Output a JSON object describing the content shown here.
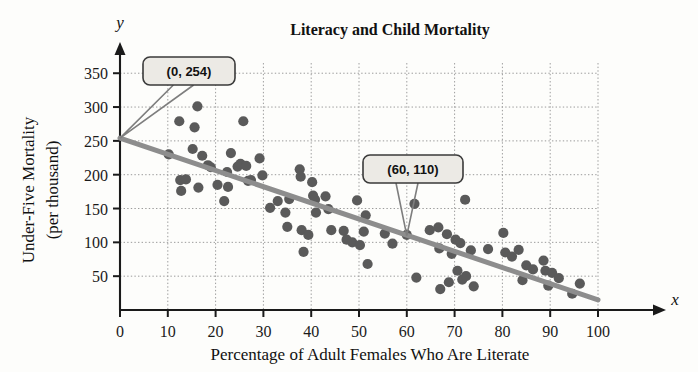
{
  "chart_data": {
    "type": "scatter",
    "title": "Literacy and Child Mortality",
    "xlabel": "Percentage of Adult Females Who Are Literate",
    "ylabel": "Under-Five Mortality\n(per thousand)",
    "ylabel_line1": "Under-Five Mortality",
    "ylabel_line2": "(per thousand)",
    "x_axis_name": "x",
    "y_axis_name": "y",
    "xlim": [
      0,
      104
    ],
    "ylim": [
      0,
      372
    ],
    "xticks": [
      0,
      10,
      20,
      30,
      40,
      50,
      60,
      70,
      80,
      90,
      100
    ],
    "yticks": [
      50,
      100,
      150,
      200,
      250,
      300,
      350
    ],
    "grid": true,
    "grid_style": "dotted",
    "legend": "none",
    "trend_line": {
      "label": "regression line",
      "x0": 0,
      "y0": 254,
      "x1": 100,
      "y1": 15
    },
    "annotations": [
      {
        "label": "(0, 254)",
        "point_x": 0,
        "point_y": 254,
        "box_x": 143,
        "box_y": 57,
        "box_w": 92,
        "box_h": 28
      },
      {
        "label": "(60, 110)",
        "point_x": 60,
        "point_y": 110,
        "box_x": 363,
        "box_y": 155,
        "box_w": 100,
        "box_h": 28
      }
    ],
    "points": [
      [
        10.2,
        230
      ],
      [
        12.4,
        279
      ],
      [
        12.6,
        192
      ],
      [
        12.8,
        176
      ],
      [
        15.2,
        238
      ],
      [
        15.6,
        270
      ],
      [
        16.2,
        301
      ],
      [
        16.4,
        181
      ],
      [
        17.2,
        228
      ],
      [
        18.4,
        214
      ],
      [
        19.0,
        211
      ],
      [
        21.8,
        161
      ],
      [
        22.4,
        204
      ],
      [
        22.6,
        182
      ],
      [
        23.2,
        232
      ],
      [
        24.6,
        212
      ],
      [
        25.2,
        216
      ],
      [
        25.8,
        279
      ],
      [
        26.4,
        213
      ],
      [
        26.8,
        191
      ],
      [
        29.2,
        224
      ],
      [
        29.8,
        199
      ],
      [
        31.4,
        151
      ],
      [
        34.6,
        144
      ],
      [
        35.0,
        123
      ],
      [
        35.4,
        164
      ],
      [
        37.6,
        208
      ],
      [
        37.8,
        197
      ],
      [
        38.0,
        118
      ],
      [
        38.4,
        86
      ],
      [
        39.4,
        111
      ],
      [
        40.2,
        189
      ],
      [
        40.4,
        169
      ],
      [
        40.8,
        163
      ],
      [
        41.0,
        144
      ],
      [
        43.6,
        149
      ],
      [
        44.2,
        118
      ],
      [
        46.8,
        117
      ],
      [
        47.4,
        104
      ],
      [
        48.6,
        100
      ],
      [
        49.6,
        162
      ],
      [
        50.2,
        96
      ],
      [
        51.0,
        116
      ],
      [
        51.4,
        140
      ],
      [
        51.8,
        68
      ],
      [
        57.0,
        98
      ],
      [
        60.0,
        111
      ],
      [
        61.6,
        157
      ],
      [
        62.0,
        48
      ],
      [
        66.6,
        122
      ],
      [
        66.8,
        91
      ],
      [
        67.0,
        31
      ],
      [
        68.4,
        112
      ],
      [
        68.8,
        41
      ],
      [
        69.4,
        83
      ],
      [
        70.2,
        104
      ],
      [
        70.6,
        58
      ],
      [
        71.2,
        99
      ],
      [
        71.6,
        45
      ],
      [
        72.2,
        163
      ],
      [
        72.4,
        50
      ],
      [
        73.4,
        88
      ],
      [
        74.0,
        35
      ],
      [
        80.2,
        114
      ],
      [
        80.6,
        85
      ],
      [
        82.0,
        79
      ],
      [
        83.4,
        89
      ],
      [
        84.2,
        44
      ],
      [
        85.0,
        66
      ],
      [
        86.4,
        60
      ],
      [
        88.6,
        73
      ],
      [
        89.0,
        58
      ],
      [
        89.6,
        36
      ],
      [
        90.4,
        55
      ],
      [
        91.8,
        47
      ],
      [
        94.6,
        24
      ],
      [
        96.2,
        39
      ],
      [
        13.8,
        193
      ],
      [
        20.4,
        185
      ],
      [
        27.4,
        192
      ],
      [
        33.0,
        161
      ],
      [
        43.0,
        168
      ],
      [
        55.4,
        113
      ],
      [
        64.8,
        118
      ],
      [
        77.0,
        90
      ]
    ]
  }
}
